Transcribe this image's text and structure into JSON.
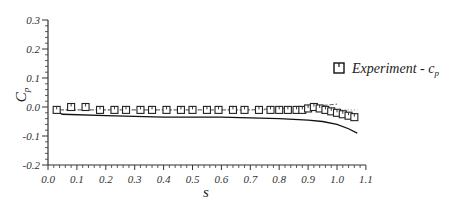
{
  "chart_data": {
    "type": "line",
    "title": "",
    "xlabel": "s",
    "ylabel": "C_p",
    "xlim": [
      0.0,
      1.1
    ],
    "ylim": [
      -0.2,
      0.3
    ],
    "x_ticks": [
      "0.0",
      "0.1",
      "0.2",
      "0.3",
      "0.4",
      "0.5",
      "0.6",
      "0.7",
      "0.8",
      "0.9",
      "1.0",
      "1.1"
    ],
    "y_ticks": [
      "0.3",
      "0.2",
      "0.1",
      "0.0",
      "-0.1",
      "-0.2"
    ],
    "grid": false,
    "legend_position": "right",
    "legend": [
      {
        "label": "Experiment - c_p",
        "marker": "square"
      }
    ],
    "series": [
      {
        "name": "Experiment - c_p",
        "style": "square-markers",
        "x": [
          0.03,
          0.08,
          0.13,
          0.18,
          0.23,
          0.27,
          0.32,
          0.36,
          0.41,
          0.46,
          0.5,
          0.55,
          0.59,
          0.64,
          0.68,
          0.73,
          0.77,
          0.8,
          0.83,
          0.86,
          0.88,
          0.9,
          0.92,
          0.94,
          0.96,
          0.98,
          1.0,
          1.02,
          1.04,
          1.06
        ],
        "y": [
          -0.01,
          0.0,
          0.0,
          -0.01,
          -0.01,
          -0.01,
          -0.01,
          -0.01,
          -0.01,
          -0.01,
          -0.01,
          -0.01,
          -0.01,
          -0.01,
          -0.01,
          -0.01,
          -0.01,
          -0.01,
          -0.01,
          -0.01,
          -0.01,
          -0.005,
          0.0,
          -0.005,
          -0.01,
          -0.015,
          -0.02,
          -0.025,
          -0.03,
          -0.035
        ]
      },
      {
        "name": "Computation (solid)",
        "style": "solid",
        "x": [
          0.02,
          0.05,
          0.2,
          0.4,
          0.6,
          0.8,
          0.9,
          0.95,
          1.0,
          1.04,
          1.07
        ],
        "y": [
          -0.01,
          -0.025,
          -0.03,
          -0.035,
          -0.035,
          -0.04,
          -0.045,
          -0.05,
          -0.06,
          -0.075,
          -0.09
        ]
      },
      {
        "name": "Computation (dashed)",
        "style": "dashed",
        "x": [
          0.02,
          0.2,
          0.4,
          0.6,
          0.7,
          0.8,
          0.9,
          0.95,
          1.0
        ],
        "y": [
          -0.01,
          -0.01,
          -0.01,
          -0.01,
          -0.01,
          -0.005,
          0.0,
          0.005,
          0.01
        ]
      },
      {
        "name": "Computation (dotted)",
        "style": "dotted",
        "x": [
          0.02,
          0.2,
          0.4,
          0.6,
          0.8,
          0.9,
          1.0,
          1.07
        ],
        "y": [
          -0.01,
          -0.01,
          -0.01,
          -0.01,
          -0.01,
          -0.01,
          -0.01,
          -0.01
        ]
      }
    ]
  }
}
